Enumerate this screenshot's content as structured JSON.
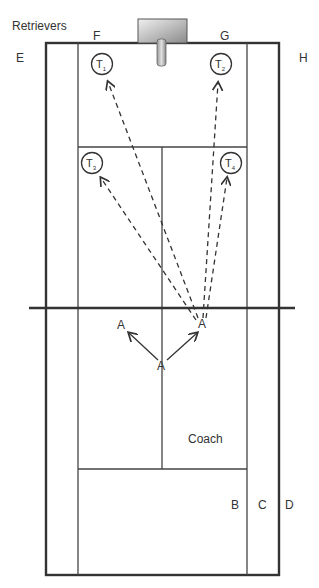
{
  "title": "Retrievers",
  "corner_labels": {
    "E": "E",
    "F": "F",
    "G": "G",
    "H": "H"
  },
  "side_labels": {
    "B": "B",
    "C": "C",
    "D": "D"
  },
  "targets": [
    {
      "id": "T1",
      "label": "T",
      "sub": "1"
    },
    {
      "id": "T2",
      "label": "T",
      "sub": "2"
    },
    {
      "id": "T3",
      "label": "T",
      "sub": "3"
    },
    {
      "id": "T4",
      "label": "T",
      "sub": "4"
    }
  ],
  "players": {
    "a_left": "A",
    "a_right": "A",
    "a_center": "A"
  },
  "coach": "Coach",
  "colors": {
    "line": "#333333",
    "machine_light": "#e8e8e8",
    "machine_dark": "#8a8a8a"
  }
}
